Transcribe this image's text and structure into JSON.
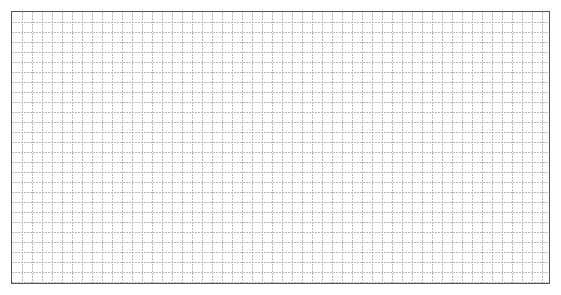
{
  "grid": {
    "cell_size": 10,
    "columns": 54,
    "rows": 27,
    "line_color": "#b8b8b8",
    "border_color": "#555555",
    "background": "#ffffff",
    "line_style": "dotted"
  }
}
